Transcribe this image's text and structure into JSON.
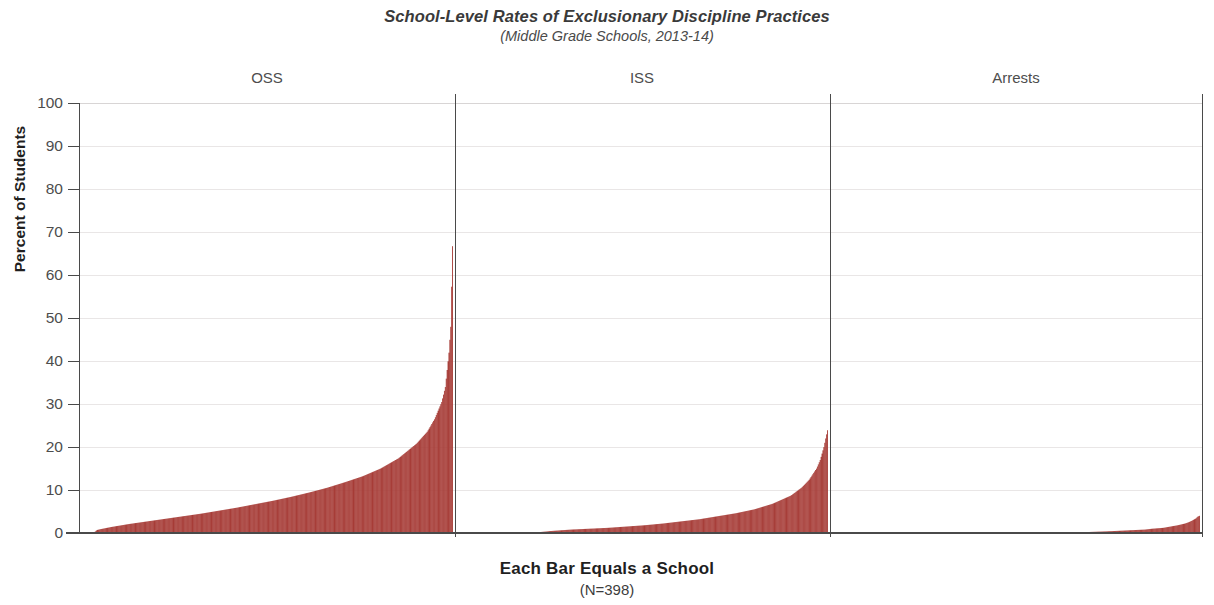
{
  "header": {
    "title": "School-Level Rates of Exclusionary Discipline Practices",
    "subtitle": "(Middle Grade Schools, 2013-14)"
  },
  "footer": {
    "caption": "Each Bar Equals a School",
    "sample_size": "(N=398)"
  },
  "axes": {
    "y_title": "Percent of Students",
    "y_ticks": [
      "100",
      "90",
      "80",
      "70",
      "60",
      "50",
      "40",
      "30",
      "20",
      "10",
      "0"
    ]
  },
  "style": {
    "bar_color": "#A63B36",
    "axis_color": "#4a4a4a",
    "grid_color": "#e9e6e6",
    "background": "#ffffff"
  },
  "panels": [
    {
      "label": "OSS"
    },
    {
      "label": "ISS"
    },
    {
      "label": "Arrests"
    }
  ],
  "chart_data": {
    "type": "bar",
    "title": "School-Level Rates of Exclusionary Discipline Practices",
    "subtitle": "(Middle Grade Schools, 2013-14)",
    "xlabel": "Each Bar Equals a School",
    "ylabel": "Percent of Students",
    "ylim": [
      0,
      100
    ],
    "yticks": [
      0,
      10,
      20,
      30,
      40,
      50,
      60,
      70,
      80,
      90,
      100
    ],
    "grid": true,
    "legend": "none",
    "n_schools": 398,
    "note": "Each panel is a separate sorted distribution of 398 schools; bars sorted ascending left to right. Values are percent of students.",
    "series": [
      {
        "name": "OSS",
        "panel": 0,
        "n": 398,
        "min": 0.0,
        "max": 66.7,
        "percentiles": {
          "p0": 0.0,
          "p1": 0.7,
          "p2": 0.9,
          "p5": 1.4,
          "p10": 2.1,
          "p15": 2.7,
          "p20": 3.3,
          "p25": 3.9,
          "p30": 4.5,
          "p35": 5.2,
          "p40": 5.9,
          "p45": 6.7,
          "p50": 7.5,
          "p55": 8.4,
          "p60": 9.4,
          "p65": 10.5,
          "p70": 11.8,
          "p75": 13.2,
          "p80": 15.0,
          "p85": 17.4,
          "p90": 20.8,
          "p93": 23.6,
          "p95": 26.5,
          "p97": 30.5,
          "p98": 34.0,
          "p99": 42.0,
          "p99.5": 48.0,
          "p100": 66.7
        }
      },
      {
        "name": "ISS",
        "panel": 1,
        "n": 398,
        "min": 0.0,
        "max": 23.9,
        "percentiles": {
          "p0": 0.0,
          "p5": 0.0,
          "p10": 0.0,
          "p15": 0.0,
          "p20": 0.1,
          "p25": 0.5,
          "p30": 0.8,
          "p35": 1.0,
          "p40": 1.2,
          "p45": 1.5,
          "p50": 1.8,
          "p55": 2.2,
          "p60": 2.7,
          "p65": 3.2,
          "p70": 3.9,
          "p75": 4.6,
          "p80": 5.5,
          "p85": 6.8,
          "p90": 8.7,
          "p93": 10.6,
          "p95": 12.4,
          "p97": 15.0,
          "p98": 17.0,
          "p99": 20.0,
          "p99.5": 22.0,
          "p100": 23.9
        }
      },
      {
        "name": "Arrests",
        "panel": 2,
        "n": 398,
        "min": 0.0,
        "max": 4.0,
        "percentiles": {
          "p0": 0.0,
          "p10": 0.0,
          "p20": 0.0,
          "p30": 0.0,
          "p40": 0.0,
          "p50": 0.0,
          "p60": 0.0,
          "p65": 0.0,
          "p70": 0.25,
          "p75": 0.4,
          "p80": 0.6,
          "p85": 0.8,
          "p87": 1.0,
          "p90": 1.2,
          "p92": 1.5,
          "p94": 1.8,
          "p95": 2.0,
          "p96": 2.2,
          "p97": 2.5,
          "p98": 2.9,
          "p99": 3.4,
          "p99.5": 3.8,
          "p100": 4.0
        }
      }
    ]
  }
}
